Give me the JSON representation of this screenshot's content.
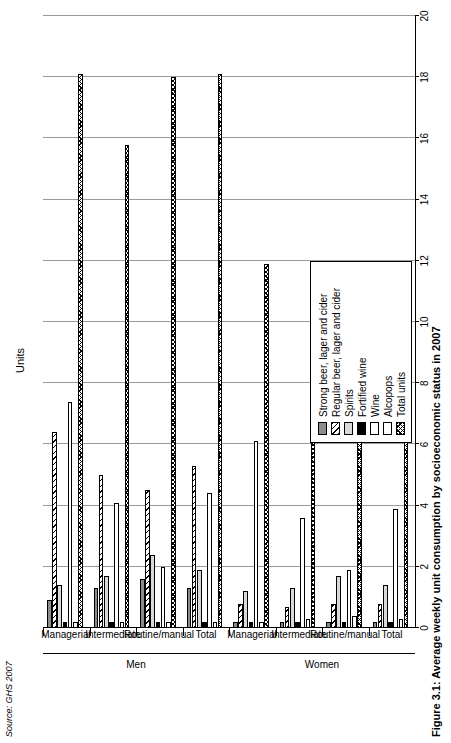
{
  "figure": {
    "source": "Source: GHS 2007",
    "caption": "Figure 3.1: Average weekly unit consumption by socioeconomic status in 2007",
    "axis_title": "Units"
  },
  "legend": {
    "items": [
      {
        "label": "Strong beer, lager and cider",
        "fill": "strong",
        "color": "#8c8c8c"
      },
      {
        "label": "Regular beer, lager and cider",
        "fill": "regular",
        "color": "#ffffff"
      },
      {
        "label": "Spirits",
        "fill": "spirits",
        "color": "#d9d9d9"
      },
      {
        "label": "Fortified wine",
        "fill": "fortified",
        "color": "#000000"
      },
      {
        "label": "Wine",
        "fill": "wine",
        "color": "#ffffff"
      },
      {
        "label": "Alcopops",
        "fill": "alcopops",
        "color": "#ffffff"
      },
      {
        "label": "Total units",
        "fill": "total",
        "color": "#ffffff"
      }
    ]
  },
  "chart_data": {
    "type": "bar",
    "orientation": "horizontal",
    "title": "Figure 3.1: Average weekly unit consumption by socioeconomic status in 2007",
    "xlabel": "Units",
    "ylabel": "",
    "xlim": [
      0,
      20
    ],
    "xticks": [
      0,
      2,
      4,
      6,
      8,
      10,
      12,
      14,
      16,
      18,
      20
    ],
    "grid": true,
    "legend_position": "right",
    "group_labels": [
      "Men",
      "Women"
    ],
    "categories": [
      {
        "group": "Men",
        "label": "Managerial"
      },
      {
        "group": "Men",
        "label": "Intermediate"
      },
      {
        "group": "Men",
        "label": "Routine/manual"
      },
      {
        "group": "Men",
        "label": "Total"
      },
      {
        "group": "Women",
        "label": "Managerial"
      },
      {
        "group": "Women",
        "label": "Intermediate"
      },
      {
        "group": "Women",
        "label": "Routine/manual"
      },
      {
        "group": "Women",
        "label": "Total"
      }
    ],
    "series": [
      {
        "name": "Strong beer, lager and cider",
        "values": [
          0.9,
          1.3,
          1.6,
          1.3,
          0.2,
          0.2,
          0.2,
          0.2
        ]
      },
      {
        "name": "Regular beer, lager and cider",
        "values": [
          6.4,
          5.0,
          4.5,
          5.3,
          0.8,
          0.7,
          0.8,
          0.8
        ]
      },
      {
        "name": "Spirits",
        "values": [
          1.4,
          1.7,
          2.4,
          1.9,
          1.2,
          1.3,
          1.7,
          1.4
        ]
      },
      {
        "name": "Fortified wine",
        "values": [
          0.2,
          0.2,
          0.2,
          0.2,
          0.2,
          0.2,
          0.2,
          0.2
        ]
      },
      {
        "name": "Wine",
        "values": [
          7.4,
          4.1,
          2.0,
          4.4,
          6.1,
          3.6,
          1.9,
          3.9
        ]
      },
      {
        "name": "Alcopops",
        "values": [
          0.2,
          0.2,
          0.2,
          0.2,
          0.2,
          0.3,
          0.4,
          0.3
        ]
      },
      {
        "name": "Total units",
        "values": [
          18.1,
          15.8,
          18.0,
          18.1,
          11.9,
          9.9,
          7.9,
          9.7
        ]
      }
    ]
  }
}
